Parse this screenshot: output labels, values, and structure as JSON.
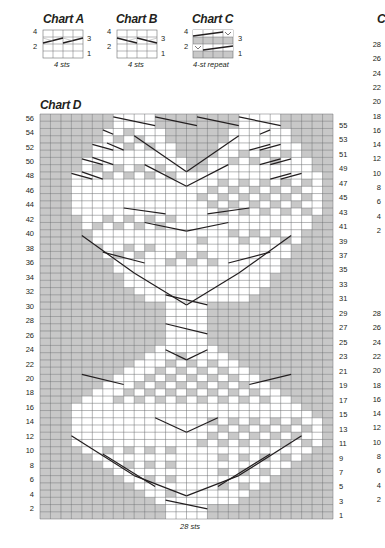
{
  "charts": {
    "a": {
      "title": "Chart A",
      "caption": "4 sts",
      "left_labels": [
        "4",
        "2"
      ],
      "right_labels": [
        "3",
        "1"
      ],
      "cols": 4,
      "rows": 4
    },
    "b": {
      "title": "Chart B",
      "caption": "4 sts",
      "left_labels": [
        "4",
        "2"
      ],
      "right_labels": [
        "3",
        "1"
      ],
      "cols": 4,
      "rows": 4
    },
    "c": {
      "title": "Chart C",
      "caption": "4-st repeat",
      "left_labels": [
        "4",
        "2"
      ],
      "right_labels": [
        "3",
        "1"
      ],
      "cols": 4,
      "rows": 4,
      "slip_symbol": "V"
    },
    "d": {
      "title": "Chart D",
      "caption": "28 sts",
      "cols": 28,
      "rows": 56,
      "left_labels": [
        "56",
        "54",
        "52",
        "50",
        "48",
        "46",
        "44",
        "42",
        "40",
        "38",
        "36",
        "34",
        "32",
        "30",
        "28",
        "26",
        "24",
        "22",
        "20",
        "18",
        "16",
        "14",
        "12",
        "10",
        "8",
        "6",
        "4",
        "2"
      ],
      "right_labels": [
        "55",
        "53",
        "51",
        "49",
        "47",
        "45",
        "43",
        "41",
        "39",
        "37",
        "35",
        "33",
        "31",
        "29",
        "27",
        "25",
        "23",
        "21",
        "19",
        "17",
        "15",
        "13",
        "11",
        "9",
        "7",
        "5",
        "3",
        "1"
      ],
      "colors": {
        "gray": "#c8c8c8",
        "white": "#ffffff",
        "grid": "#6d6e71",
        "cable": "#231f20"
      },
      "grid_rows_top_to_bottom": [
        "GGGGGGGWWWWGGGGGGGGWWWWGGGGG",
        "GGGGGGGWWWWGGGGGGGGWWWWGGGGG",
        "GGGGGGWWCWWWGGGGGGWWWCWWGGGG",
        "GGGGGGWCWCWWGGGGGGWWCWCWGGGG",
        "GGGGGWWWCWCWWGGGGWWCWCWWWGGG",
        "GGGGGWCWCWCWWGGGGWWCWCWCWGGG",
        "GGGGWWWCWCWCWWGGWWCWCWCWWWGG",
        "GGGGWCWCWCWCWWGGWWCWCWCWCWGG",
        "GGGWWWCWCWCWCWWWWCWCWCWCWWWG",
        "GGGWCWCWCWCWCWWWWCWCWCWCWCWG",
        "GGGWWCWCWCWCWCWWCWCWCWCWCWWG",
        "GGGWCWCWCWCWCWCCWCWCWCWCWCWG",
        "GGGWWCWCWCWCWCWWCWCWCWCWCWWG",
        "GGGWCWCWCWCWCWWWWCWCWCWCWCWG",
        "GGGGWWCWCWCWCWWWWCWCWCWCWWGG",
        "GGGGWCWCWCWCWWWWWWCWCWCWCWGG",
        "GGGGGWWCWCWCWWWWWWCWCWCWWGGG",
        "GGGGGWCWCWCWWWCCWWWCWCWCWGGG",
        "GGGGGGWWCWCWWCWCWWWCWCWWGGGG",
        "GGGGGGWCWCWWWCWCWWWWCWCWGGGG",
        "GGGGGGGWWCWWCWCWCWWCWWWGGGGG",
        "GGGGGGGWCWWWCWCWCWWWCWWGGGGG",
        "GGGGGGGGWWWCWCWCWCWWWWGGGGGG",
        "GGGGGGGGWWWWCWCWCWWWWWGGGGGG",
        "GGGGGGGGGWWWWCWCWWWWWGGGGGGG",
        "GGGGGGGGGGWWWWWWWWWWGGGGGGGG",
        "GGGGGGGGGGGGWWWWGGGGGGGGGGGG",
        "GGGGGGGGGGGGWWWWGGGGGGGGGGGG",
        "GGGGGGGGGGGGWWWWGGGGGGGGGGGG",
        "GGGGGGGGGGGGWWWWGGGGGGGGGGGG",
        "GGGGGGGGGGGGWWWWGGGGGGGGGGGG",
        "GGGGGGGGGGGGWWWWGGGGGGGGGGGG",
        "GGGGGGGGGGGWWWWWWGGGGGGGGGGG",
        "GGGGGGGGGGWWWCCWWWGGGGGGGGGG",
        "GGGGGGGGGWWWCWCWCWWGGGGGGGGG",
        "GGGGGGGGWWWCWCWCWCWWGGGGGGGG",
        "GGGGGGGWWWCWCWCWCWCWWGGGGGGG",
        "GGGGGGWWWCWCWCWCWCWCWWGGGGGG",
        "GGGGGWWWCWCWCWCWCWCWCWWGGGGG",
        "GGGGWWWCWCWCWCWCWCWCWCWWGGGG",
        "GGGWWCWCWCWCWCWCWCWCWCWWWGGG",
        "GGGWCWCWCWCWCWCWCWCWCWCWCWGG",
        "GGGWWCWCWCWCWCWWCWCWCWCWCWWG",
        "GGGWCWCWCWCWCWWWWCWCWCWCWCWG",
        "GGGWWCWCWCWCWCWWCWCWCWCWCWWG",
        "GGGWCWCWCWCWCWCCWCWCWCWCWCWG",
        "GGGGWWCWCWCWCWWWWCWCWCWCWWGG",
        "GGGGGWCWCWCWCWWWWCWCWCWCWGGG",
        "GGGGGGWWCWCWCWWWWCWCWCWWGGGG",
        "GGGGGGGWCWCWCWWWWCWCWCWGGGGG",
        "GGGGGGGGWWCWCWWWWCWCWWGGGGGG",
        "GGGGGGGGGWCWCWWWWCWCWGGGGGGG",
        "GGGGGGGGGGWWCWWWWCWWGGGGGGGG",
        "GGGGGGGGGGGWWWWWWWWGGGGGGGGG",
        "GGGGGGGGGGGGWWWWGGGGGGGGGGGG",
        "GGGGGGGGGGGGWWWWGGGGGGGGGGGG"
      ],
      "cables": [
        [
          7,
          55.6,
          11,
          54.4
        ],
        [
          19,
          55.6,
          23,
          54.4
        ],
        [
          11,
          55.6,
          15,
          54.4
        ],
        [
          15,
          55.6,
          19,
          54.4
        ],
        [
          6,
          53.8,
          7,
          53.2
        ],
        [
          21,
          53.2,
          22,
          53.8
        ],
        [
          5,
          51.8,
          7,
          51
        ],
        [
          8,
          51,
          6.4,
          52
        ],
        [
          20,
          51,
          22,
          51.8
        ],
        [
          23,
          51.8,
          21,
          51
        ],
        [
          4,
          49.8,
          6,
          49
        ],
        [
          7,
          49,
          5,
          50
        ],
        [
          21,
          49,
          23,
          49.8
        ],
        [
          24,
          49.8,
          22,
          49
        ],
        [
          3,
          47.8,
          5,
          47
        ],
        [
          6,
          47,
          4,
          48
        ],
        [
          22,
          47,
          24,
          47.8
        ],
        [
          25,
          47.8,
          23,
          47
        ],
        [
          9,
          53,
          14,
          48
        ],
        [
          14,
          48,
          19,
          53
        ],
        [
          10,
          49,
          14,
          46
        ],
        [
          14,
          46,
          18,
          49
        ],
        [
          8,
          43,
          12,
          42.2
        ],
        [
          16,
          42.2,
          20,
          43
        ],
        [
          10,
          41,
          14,
          39.8
        ],
        [
          14,
          39.8,
          18,
          41
        ],
        [
          4,
          39.2,
          9,
          34
        ],
        [
          24,
          39.2,
          19,
          34
        ],
        [
          6,
          36.9,
          10,
          35.4
        ],
        [
          18,
          35.4,
          22,
          36.9
        ],
        [
          9,
          34,
          14,
          29.6
        ],
        [
          19,
          34,
          14,
          29.6
        ],
        [
          12,
          31,
          16,
          29.6
        ],
        [
          12,
          27,
          16,
          25.6
        ],
        [
          12,
          23.4,
          14,
          22
        ],
        [
          14,
          22,
          16,
          23.4
        ],
        [
          4,
          20,
          8,
          18.6
        ],
        [
          20,
          18.6,
          24,
          20
        ],
        [
          11,
          14,
          14,
          12
        ],
        [
          14,
          12,
          17,
          14
        ],
        [
          3,
          11.5,
          9,
          6
        ],
        [
          25,
          11.5,
          19,
          6
        ],
        [
          9,
          6,
          14,
          3.2
        ],
        [
          14,
          3.2,
          19,
          6
        ],
        [
          6,
          9,
          11,
          4.5
        ],
        [
          22,
          9,
          17,
          4.5
        ],
        [
          12,
          2.6,
          16,
          1.4
        ]
      ]
    },
    "e_partial": {
      "title_fragment": "C",
      "labels_top": [
        "28",
        "26",
        "24",
        "22",
        "20",
        "18",
        "16",
        "14",
        "12",
        "10",
        "8",
        "6",
        "4",
        "2"
      ],
      "labels_bottom": [
        "28",
        "26",
        "24",
        "22",
        "20",
        "18",
        "16",
        "14",
        "12",
        "10",
        "8",
        "6",
        "4",
        "2"
      ]
    }
  }
}
